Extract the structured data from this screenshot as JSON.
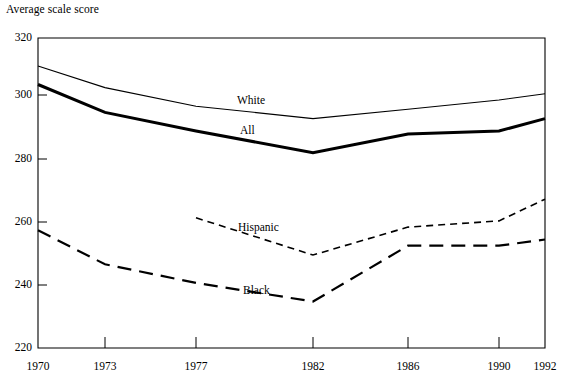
{
  "chart_data": {
    "type": "line",
    "title": "Average scale score",
    "xlabel": "",
    "ylabel": "Average scale score",
    "x": [
      1970,
      1973,
      1977,
      1982,
      1986,
      1990,
      1992
    ],
    "xticklabels": [
      "1970",
      "1973",
      "1977",
      "1982",
      "1986",
      "1990",
      "1992"
    ],
    "yticklabels": [
      "320",
      "300",
      "280",
      "260",
      "240",
      "220"
    ],
    "yticks": [
      320,
      300,
      280,
      260,
      240,
      220
    ],
    "ylim": [
      220,
      320
    ],
    "xlim": [
      1970,
      1992
    ],
    "grid": false,
    "legend_position": "inline-labels",
    "series": [
      {
        "name": "White",
        "label": "White",
        "style": "solid-thin",
        "color": "#000000",
        "x": [
          1970,
          1973,
          1977,
          1982,
          1986,
          1990,
          1992
        ],
        "values": [
          311,
          304,
          298,
          294,
          297,
          300,
          302
        ]
      },
      {
        "name": "All",
        "label": "All",
        "style": "solid-thick",
        "color": "#000000",
        "x": [
          1970,
          1973,
          1977,
          1982,
          1986,
          1990,
          1992
        ],
        "values": [
          305,
          296,
          290,
          283,
          289,
          290,
          294
        ]
      },
      {
        "name": "Hispanic",
        "label": "Hispanic",
        "style": "dashed-short",
        "color": "#000000",
        "x": [
          1977,
          1982,
          1986,
          1990,
          1992
        ],
        "values": [
          262,
          250,
          259,
          261,
          268
        ]
      },
      {
        "name": "Black",
        "label": "Black",
        "style": "dashed-long",
        "color": "#000000",
        "x": [
          1970,
          1973,
          1977,
          1982,
          1986,
          1990,
          1992
        ],
        "values": [
          258,
          247,
          241,
          235,
          253,
          253,
          255
        ]
      }
    ],
    "series_labels": [
      {
        "text": "White",
        "x": 237,
        "y": 94
      },
      {
        "text": "All",
        "x": 240,
        "y": 124
      },
      {
        "text": "Hispanic",
        "x": 238,
        "y": 221
      },
      {
        "text": "Black",
        "x": 243,
        "y": 284
      }
    ]
  },
  "axes": {
    "plot_left": 38,
    "plot_right": 545,
    "plot_top": 38,
    "plot_bottom": 348,
    "ytick_px": [
      38,
      95,
      159,
      222,
      285,
      348
    ],
    "xtick_px": [
      38,
      105,
      196,
      313,
      408,
      499,
      545
    ]
  }
}
